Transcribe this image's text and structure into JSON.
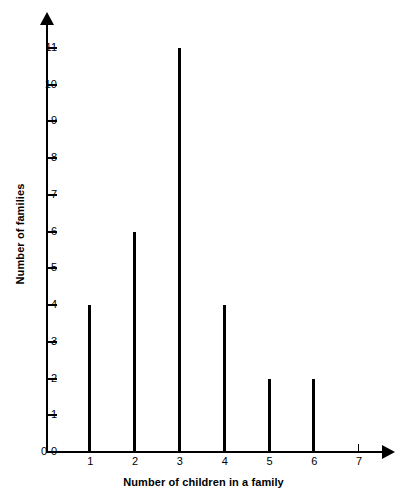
{
  "chart_data": {
    "type": "bar",
    "title": "",
    "xlabel": "Number of children in a family",
    "ylabel": "Number of families",
    "categories": [
      "1",
      "2",
      "3",
      "4",
      "5",
      "6",
      "7"
    ],
    "values": [
      4,
      6,
      11,
      4,
      2,
      2,
      0
    ],
    "x": [
      1,
      2,
      3,
      4,
      5,
      6,
      7
    ],
    "xlim": [
      0,
      7
    ],
    "ylim": [
      0,
      11
    ],
    "y_tick_labels": [
      "0",
      "1",
      "2",
      "3",
      "4",
      "5",
      "6",
      "7",
      "8",
      "9",
      "10",
      "11"
    ],
    "y_ticks": [
      0,
      1,
      2,
      3,
      4,
      5,
      6,
      7,
      8,
      9,
      10,
      11
    ],
    "x_tick_labels": [
      "1",
      "2",
      "3",
      "4",
      "5",
      "6",
      "7"
    ],
    "origin_label": "0",
    "grid": false,
    "legend": null,
    "bar_color": "#000000",
    "axis_color": "#000000",
    "background_color": "#ffffff"
  }
}
